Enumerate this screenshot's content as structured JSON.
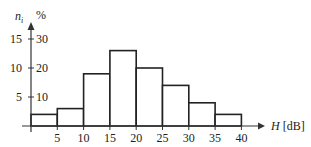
{
  "chart_data": {
    "type": "bar",
    "subtype": "histogram",
    "title": "",
    "xlabel": "H [dB]",
    "xlabel_var": "H",
    "xlabel_unit": "[dB]",
    "ylabel_left": "n_i",
    "ylabel_left_var": "n",
    "ylabel_left_sub": "i",
    "ylabel_right": "%",
    "bin_edges": [
      0,
      5,
      10,
      15,
      20,
      25,
      30,
      35,
      40
    ],
    "categories": [
      "0-5",
      "5-10",
      "10-15",
      "15-20",
      "20-25",
      "25-30",
      "30-35",
      "35-40"
    ],
    "series": [
      {
        "name": "n_i",
        "values": [
          2,
          3,
          9,
          13,
          10,
          7,
          4,
          2
        ]
      },
      {
        "name": "%",
        "values": [
          4,
          6,
          18,
          26,
          20,
          14,
          8,
          4
        ]
      }
    ],
    "x_ticks": [
      "5",
      "10",
      "15",
      "20",
      "25",
      "30",
      "35",
      "40"
    ],
    "y_ticks_left": [
      "5",
      "10",
      "15"
    ],
    "y_ticks_right": [
      "10",
      "20",
      "30"
    ],
    "xlim": [
      0,
      40
    ],
    "ylim_left": [
      0,
      15
    ],
    "ylim_right": [
      0,
      30
    ],
    "grid": false,
    "legend": null
  }
}
